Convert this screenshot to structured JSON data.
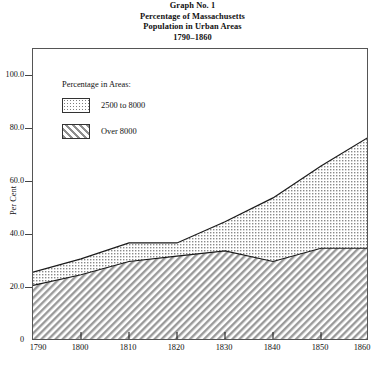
{
  "title": {
    "line1": "Graph No. 1",
    "line2": "Percentage of Massachusetts",
    "line3": "Population in Urban Areas",
    "line4": "1790–1860"
  },
  "legend": {
    "heading": "Percentage in Areas:",
    "entries": [
      {
        "label": "2500 to 8000",
        "pattern": "dotted",
        "color": "#d9d9d9"
      },
      {
        "label": "Over 8000",
        "pattern": "diagonal-hatch",
        "color": "#c8c8c8"
      }
    ]
  },
  "axes": {
    "ylabel": "Per Cent",
    "yticks": [
      "0",
      "20.0",
      "40.0",
      "60.0",
      "80.0",
      "100.0"
    ],
    "xticks": [
      "1790",
      "1800",
      "1810",
      "1820",
      "1830",
      "1840",
      "1850",
      "1860"
    ]
  },
  "chart_data": {
    "type": "area",
    "xlabel": "",
    "ylabel": "Per Cent",
    "x": [
      1790,
      1800,
      1810,
      1820,
      1830,
      1840,
      1850,
      1860
    ],
    "categories": [
      "1790",
      "1800",
      "1810",
      "1820",
      "1830",
      "1840",
      "1850",
      "1860"
    ],
    "stacked": true,
    "series": [
      {
        "name": "Over 8000",
        "pattern": "diagonal-hatch",
        "values": [
          21.0,
          25.0,
          30.0,
          32.0,
          34.0,
          30.0,
          35.0,
          35.0
        ]
      },
      {
        "name": "2500 to 8000",
        "pattern": "dotted",
        "cumulative_values": [
          26.0,
          31.0,
          37.0,
          37.0,
          45.0,
          54.0,
          66.0,
          77.0
        ],
        "values": [
          5.0,
          6.0,
          7.0,
          5.0,
          11.0,
          24.0,
          31.0,
          42.0
        ]
      }
    ],
    "ylim": [
      0,
      110
    ],
    "xlim": [
      1790,
      1860
    ],
    "grid": false,
    "legend_position": "inside-top-left"
  }
}
